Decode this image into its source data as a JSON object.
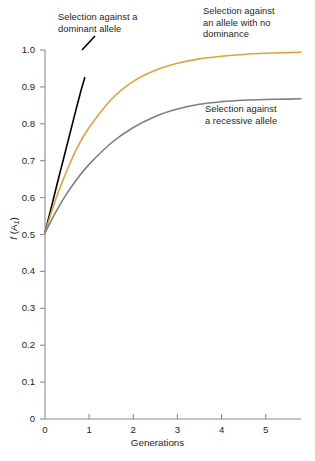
{
  "chart_data": {
    "type": "line",
    "title": "",
    "xlabel": "Generations",
    "ylabel": "f (A1)",
    "xlim": [
      0,
      5.8
    ],
    "ylim": [
      0,
      1.0
    ],
    "grid": false,
    "legend_position": "inline-annotations",
    "x_ticks": [
      "0",
      "1",
      "2",
      "3",
      "4",
      "5"
    ],
    "y_ticks": [
      "0",
      "0.1",
      "0.2",
      "0.3",
      "0.4",
      "0.5",
      "0.6",
      "0.7",
      "0.8",
      "0.9",
      "1.0"
    ],
    "series": [
      {
        "name": "Selection against a dominant allele",
        "color": "#000000",
        "x": [
          0,
          0.1,
          0.2,
          0.3,
          0.4,
          0.5,
          0.6,
          0.7,
          0.8,
          0.9
        ],
        "values": [
          0.505,
          0.553,
          0.601,
          0.649,
          0.696,
          0.743,
          0.79,
          0.837,
          0.883,
          0.925
        ]
      },
      {
        "name": "Selection against an allele with no dominance",
        "color": "#e0a33c",
        "x": [
          0,
          0.25,
          0.5,
          0.75,
          1.0,
          1.5,
          2.0,
          2.5,
          3.0,
          3.5,
          4.0,
          4.5,
          5.0,
          5.5,
          5.8
        ],
        "values": [
          0.505,
          0.598,
          0.674,
          0.74,
          0.79,
          0.866,
          0.915,
          0.945,
          0.964,
          0.976,
          0.983,
          0.988,
          0.991,
          0.993,
          0.994
        ]
      },
      {
        "name": "Selection against a recessive allele",
        "color": "#7d7f83",
        "x": [
          0,
          0.25,
          0.5,
          0.75,
          1.0,
          1.5,
          2.0,
          2.5,
          3.0,
          3.5,
          4.0,
          4.5,
          5.0,
          5.5,
          5.8
        ],
        "values": [
          0.505,
          0.562,
          0.612,
          0.654,
          0.69,
          0.748,
          0.79,
          0.82,
          0.84,
          0.853,
          0.86,
          0.864,
          0.866,
          0.867,
          0.868
        ]
      }
    ],
    "annotations": [
      {
        "id": "dominant",
        "text": "Selection against a\ndominant allele",
        "target_series": "Selection against a dominant allele"
      },
      {
        "id": "no-dominance",
        "text": "Selection against\nan allele with no\ndominance",
        "target_series": "Selection against an allele with no dominance"
      },
      {
        "id": "recessive",
        "text": "Selection against\na recessive allele",
        "target_series": "Selection against a recessive allele"
      }
    ],
    "axis_color": "#8a8c8f",
    "background": "#ffffff"
  },
  "axes": {
    "x_title": "Generations",
    "y_title_main": "f",
    "y_title_paren_open": " (A",
    "y_title_sub": "1",
    "y_title_paren_close": ")"
  },
  "annotations": {
    "dominant": "Selection against a\ndominant allele",
    "no_dominance": "Selection against\nan allele with no\ndominance",
    "recessive": "Selection against\na recessive allele"
  },
  "y_ticks": [
    {
      "label": "1.0",
      "value": 1.0
    },
    {
      "label": "0.9",
      "value": 0.9
    },
    {
      "label": "0.8",
      "value": 0.8
    },
    {
      "label": "0.7",
      "value": 0.7
    },
    {
      "label": "0.6",
      "value": 0.6
    },
    {
      "label": "0.5",
      "value": 0.5
    },
    {
      "label": "0.4",
      "value": 0.4
    },
    {
      "label": "0.3",
      "value": 0.3
    },
    {
      "label": "0.2",
      "value": 0.2
    },
    {
      "label": "0.1",
      "value": 0.1
    },
    {
      "label": "0",
      "value": 0.0
    }
  ],
  "x_ticks": [
    {
      "label": "0",
      "value": 0
    },
    {
      "label": "1",
      "value": 1
    },
    {
      "label": "2",
      "value": 2
    },
    {
      "label": "3",
      "value": 3
    },
    {
      "label": "4",
      "value": 4
    },
    {
      "label": "5",
      "value": 5
    }
  ]
}
